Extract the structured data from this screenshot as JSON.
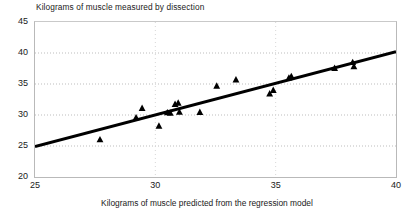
{
  "chart_data": {
    "type": "scatter",
    "title": "Kilograms of muscle measured by dissection",
    "xlabel": "Kilograms of muscle predicted from the regression model",
    "ylabel": "Kilograms of muscle measured by dissection",
    "xlim": [
      25,
      40
    ],
    "ylim": [
      20,
      45
    ],
    "xticks": [
      25,
      30,
      35,
      40
    ],
    "yticks": [
      20,
      25,
      30,
      35,
      40,
      45
    ],
    "grid": "horizontal-dotted",
    "legend": "none",
    "marker": "filled-triangle",
    "marker_color": "#000000",
    "line_color": "#000000",
    "annotation": "R2=.90, P<.0001, sd =1.34 kg",
    "annotation_parts": {
      "r": "R",
      "r_exp": "2",
      "rest": "=.90, P<.0001, sd =1.34 kg"
    },
    "points": [
      {
        "x": 27.7,
        "y": 26.05
      },
      {
        "x": 29.2,
        "y": 29.6
      },
      {
        "x": 29.45,
        "y": 31.1
      },
      {
        "x": 30.15,
        "y": 28.25
      },
      {
        "x": 30.5,
        "y": 30.4
      },
      {
        "x": 30.62,
        "y": 30.35
      },
      {
        "x": 30.82,
        "y": 31.75
      },
      {
        "x": 30.95,
        "y": 31.95
      },
      {
        "x": 31.0,
        "y": 30.5
      },
      {
        "x": 31.85,
        "y": 30.45
      },
      {
        "x": 32.55,
        "y": 34.7
      },
      {
        "x": 33.35,
        "y": 35.7
      },
      {
        "x": 34.75,
        "y": 33.45
      },
      {
        "x": 34.9,
        "y": 34.0
      },
      {
        "x": 35.55,
        "y": 36.0
      },
      {
        "x": 35.65,
        "y": 36.25
      },
      {
        "x": 37.45,
        "y": 37.55
      },
      {
        "x": 38.2,
        "y": 38.5
      },
      {
        "x": 38.25,
        "y": 37.85
      }
    ],
    "trendline": {
      "x_start": 25.0,
      "y_start": 24.9,
      "x_end": 40.0,
      "y_end": 40.2,
      "width_px": 3
    }
  }
}
